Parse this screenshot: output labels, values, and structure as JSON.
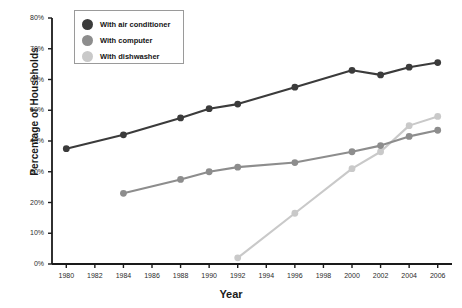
{
  "chart_data": {
    "type": "line",
    "title": "",
    "xlabel": "Year",
    "ylabel": "Percentage of Households",
    "x": [
      1980,
      1982,
      1984,
      1986,
      1988,
      1990,
      1992,
      1994,
      1996,
      1998,
      2000,
      2002,
      2004,
      2006
    ],
    "xlim": [
      1979,
      2007
    ],
    "ylim": [
      0,
      80
    ],
    "xtick_labels": [
      "1980",
      "1982",
      "1984",
      "1986",
      "1988",
      "1990",
      "1992",
      "1994",
      "1996",
      "1998",
      "2000",
      "2002",
      "2004",
      "2006"
    ],
    "ytick_labels": [
      "0%",
      "10%",
      "20%",
      "30%",
      "40%",
      "50%",
      "60%",
      "70%",
      "80%"
    ],
    "ytick_values": [
      0,
      10,
      20,
      30,
      40,
      50,
      60,
      70,
      80
    ],
    "grid": false,
    "legend_position": "top-left",
    "series": [
      {
        "name": "With air conditioner",
        "color": "#3b3b3b",
        "points": [
          {
            "x": 1980,
            "y": 37.5
          },
          {
            "x": 1984,
            "y": 42.0
          },
          {
            "x": 1988,
            "y": 47.5
          },
          {
            "x": 1990,
            "y": 50.5
          },
          {
            "x": 1992,
            "y": 52.0
          },
          {
            "x": 1996,
            "y": 57.5
          },
          {
            "x": 2000,
            "y": 63.0
          },
          {
            "x": 2002,
            "y": 61.5
          },
          {
            "x": 2004,
            "y": 64.0
          },
          {
            "x": 2006,
            "y": 65.5
          }
        ]
      },
      {
        "name": "With computer",
        "color": "#8d8d8d",
        "points": [
          {
            "x": 1984,
            "y": 23.0
          },
          {
            "x": 1988,
            "y": 27.5
          },
          {
            "x": 1990,
            "y": 30.0
          },
          {
            "x": 1992,
            "y": 31.5
          },
          {
            "x": 1996,
            "y": 33.0
          },
          {
            "x": 2000,
            "y": 36.5
          },
          {
            "x": 2002,
            "y": 38.5
          },
          {
            "x": 2004,
            "y": 41.5
          },
          {
            "x": 2006,
            "y": 43.5
          }
        ]
      },
      {
        "name": "With dishwasher",
        "color": "#c9c9c9",
        "points": [
          {
            "x": 1992,
            "y": 2.0
          },
          {
            "x": 1996,
            "y": 16.5
          },
          {
            "x": 2000,
            "y": 31.0
          },
          {
            "x": 2002,
            "y": 36.5
          },
          {
            "x": 2004,
            "y": 45.0
          },
          {
            "x": 2006,
            "y": 48.0
          }
        ]
      }
    ]
  },
  "legend": {
    "items": [
      {
        "label": "With air conditioner",
        "color": "#3b3b3b"
      },
      {
        "label": "With computer",
        "color": "#8d8d8d"
      },
      {
        "label": "With dishwasher",
        "color": "#c9c9c9"
      }
    ]
  },
  "colors": {
    "axis": "#1a1a1a",
    "text": "#1a1a1a",
    "background": "#ffffff",
    "legend_border": "#9a9a9a"
  }
}
